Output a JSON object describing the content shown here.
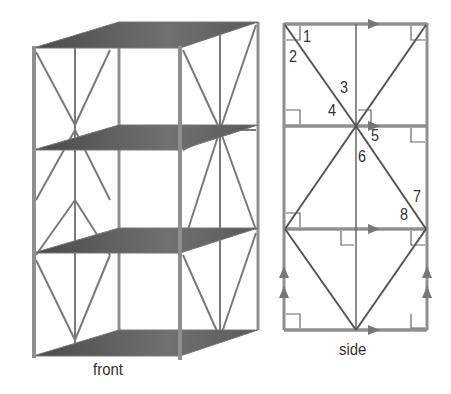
{
  "figure": {
    "front_view": {
      "caption": "front",
      "shelves": 4,
      "description": "3D shelving unit with 4 shelves, posts at corners, X-braced side panels"
    },
    "side_view": {
      "caption": "side",
      "angle_labels": [
        "1",
        "2",
        "3",
        "4",
        "5",
        "6",
        "7",
        "8"
      ],
      "markings": [
        "right-angle-marks",
        "parallel-arrow-marks"
      ]
    },
    "colors": {
      "frame": "#8a8a8a",
      "shelf": "#5a5a5a",
      "line": "#555555",
      "text": "#333333"
    }
  }
}
